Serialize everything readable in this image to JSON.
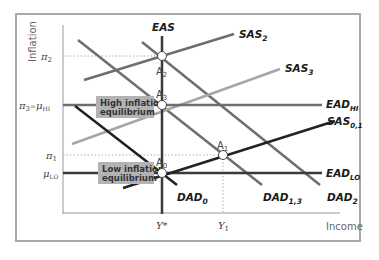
{
  "chart": {
    "y_axis_label": "Inflation",
    "x_axis_label": "Income",
    "y_ticks": {
      "pi2": "π",
      "pi2_sub": "2",
      "pi3_muhi": "π",
      "pi3_sub": "3",
      "eq": "=",
      "mu_hi": "μ",
      "mu_hi_sub": "HI",
      "pi1": "π",
      "pi1_sub": "1",
      "mu_lo": "μ",
      "mu_lo_sub": "LO"
    },
    "x_ticks": {
      "ystar": "Y*",
      "y1": "Y",
      "y1_sub": "1"
    },
    "curves": {
      "eas": "EAS",
      "sas2": "SAS",
      "sas2_sub": "2",
      "sas3": "SAS",
      "sas3_sub": "3",
      "ead_hi": "EAD",
      "ead_hi_sub": "HI",
      "sas01": "SAS",
      "sas01_sub": "0,1",
      "ead_lo": "EAD",
      "ead_lo_sub": "LO",
      "dad0": "DAD",
      "dad0_sub": "0",
      "dad13": "DAD",
      "dad13_sub": "1,3",
      "dad2": "DAD",
      "dad2_sub": "2"
    },
    "points": {
      "a0": "A",
      "a0_sub": "0",
      "a1": "A",
      "a1_sub": "1",
      "a2": "A",
      "a2_sub": "2",
      "a3": "A",
      "a3_sub": "3"
    },
    "callouts": {
      "high_line1": "High inflation",
      "high_line2": "equilibrium",
      "low_line1": "Low inflation",
      "low_line2": "equilibrium"
    },
    "colors": {
      "dark": "#222222",
      "mid": "#6e6e6e",
      "light": "#a6a6a6",
      "callout_bg": "#b3b3b3"
    }
  }
}
